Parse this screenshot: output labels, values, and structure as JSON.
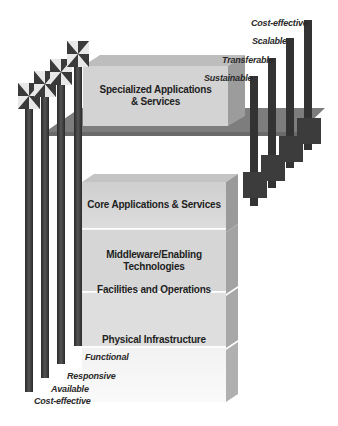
{
  "diagram": {
    "top_block": {
      "label_line1": "Specialized Applications",
      "label_line2": "& Services"
    },
    "stack_blocks": [
      {
        "label_line1": "Core Applications & Services",
        "label_line2": ""
      },
      {
        "label_line1": "Middleware/Enabling",
        "label_line2": "Technologies"
      },
      {
        "label_line1": "Facilities and Operations",
        "label_line2": ""
      },
      {
        "label_line1": "Physical Infrastructure",
        "label_line2": ""
      }
    ],
    "left_pillar_labels": [
      "Functional",
      "Responsive",
      "Available",
      "Cost-effective"
    ],
    "right_pillar_labels": [
      "Sustainable",
      "Transferable",
      "Scalable",
      "Cost-effective"
    ],
    "colors": {
      "pillar": "#3a3a3a",
      "platform": "#7a7a7a",
      "block_front": "#d4d4d4",
      "block_side": "#9a9a9a",
      "block_top": "#c0c0c0",
      "text": "#1e1e1e"
    }
  }
}
